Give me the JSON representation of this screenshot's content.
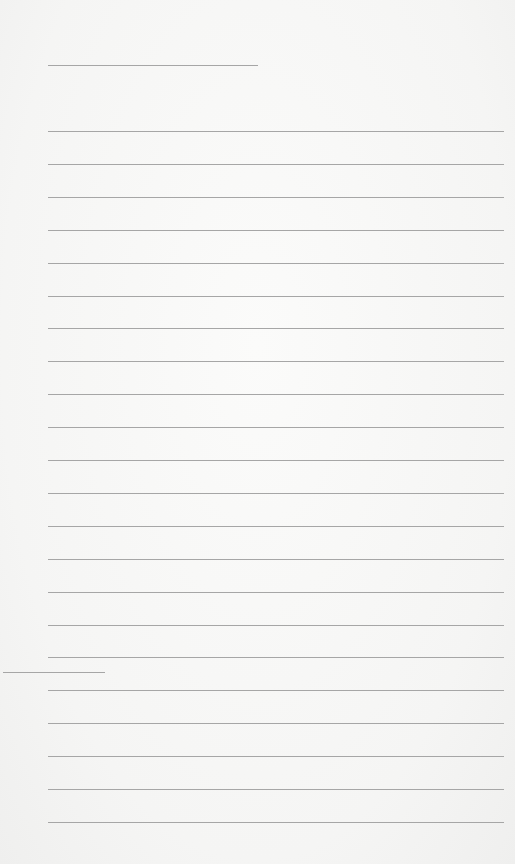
{
  "document": {
    "type": "lined-paper",
    "background_color": "#f7f7f6",
    "line_color": "#a6a6a6",
    "header_line": {
      "x1": 48,
      "x2": 258,
      "y": 65
    },
    "margin_mark": {
      "x1": 3,
      "x2": 105,
      "y": 672
    },
    "ruled_lines": {
      "x1": 48,
      "x2": 504,
      "y_start": 131,
      "spacing": 32.9,
      "count": 22
    },
    "text": ""
  }
}
